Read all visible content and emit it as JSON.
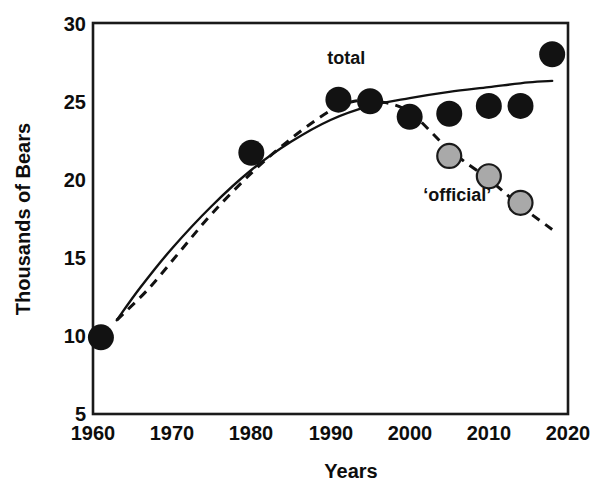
{
  "chart_data": {
    "type": "scatter",
    "title": "",
    "subtitle": "",
    "xlabel": "Years",
    "ylabel": "Thousands of Bears",
    "xlim": [
      1960,
      2020
    ],
    "ylim": [
      5,
      30
    ],
    "xticks": [
      1960,
      1970,
      1980,
      1990,
      2000,
      2010,
      2020
    ],
    "xticklabels": [
      "1960",
      "1970",
      "1980",
      "1990",
      "2000",
      "2010",
      "2020"
    ],
    "yticks": [
      5,
      10,
      15,
      20,
      25,
      30
    ],
    "yticklabels": [
      "5",
      "10",
      "15",
      "20",
      "25",
      "30"
    ],
    "grid": false,
    "legend_position": "inline-annotation",
    "annotations": [
      {
        "text": "total",
        "x": 1992,
        "y": 27.4
      },
      {
        "text": "‘official’",
        "x": 2006,
        "y": 18.6
      }
    ],
    "series": [
      {
        "name": "total",
        "marker": "filled-circle",
        "color": "#121212",
        "x": [
          1961,
          1980,
          1991,
          1995,
          2000,
          2005,
          2010,
          2014,
          2018
        ],
        "y": [
          9.9,
          21.7,
          25.1,
          25.0,
          24.0,
          24.2,
          24.7,
          24.7,
          28.0
        ]
      },
      {
        "name": "'official'",
        "marker": "gray-circle",
        "color": "#a9a9a9",
        "x": [
          2005,
          2010,
          2014
        ],
        "y": [
          21.5,
          20.2,
          18.5
        ]
      }
    ],
    "trend_lines": [
      {
        "name": "total-trend",
        "style": "solid",
        "color": "#111111",
        "x": [
          1963,
          1966,
          1970,
          1975,
          1980,
          1985,
          1990,
          1995,
          2000,
          2005,
          2010,
          2015,
          2018
        ],
        "y": [
          11.0,
          13.1,
          15.6,
          18.3,
          20.6,
          22.4,
          23.8,
          24.7,
          25.2,
          25.6,
          25.9,
          26.2,
          26.3
        ]
      },
      {
        "name": "official-trend",
        "style": "dashed",
        "color": "#111111",
        "x": [
          1963,
          1967,
          1971,
          1975,
          1980,
          1985,
          1990,
          1993,
          1996,
          2000,
          2005,
          2010,
          2014,
          2018
        ],
        "y": [
          11.0,
          13.0,
          15.4,
          17.8,
          20.4,
          22.6,
          24.4,
          25.0,
          25.0,
          24.3,
          21.9,
          20.0,
          18.3,
          16.8
        ]
      }
    ]
  },
  "figure": {
    "background": "#ffffff",
    "axis_color": "#1a1a1a",
    "text_color": "#0d0d0d",
    "total_marker_color": "#121212",
    "official_marker_fill": "#a9a9a9",
    "official_marker_stroke": "#1a1a1a"
  }
}
